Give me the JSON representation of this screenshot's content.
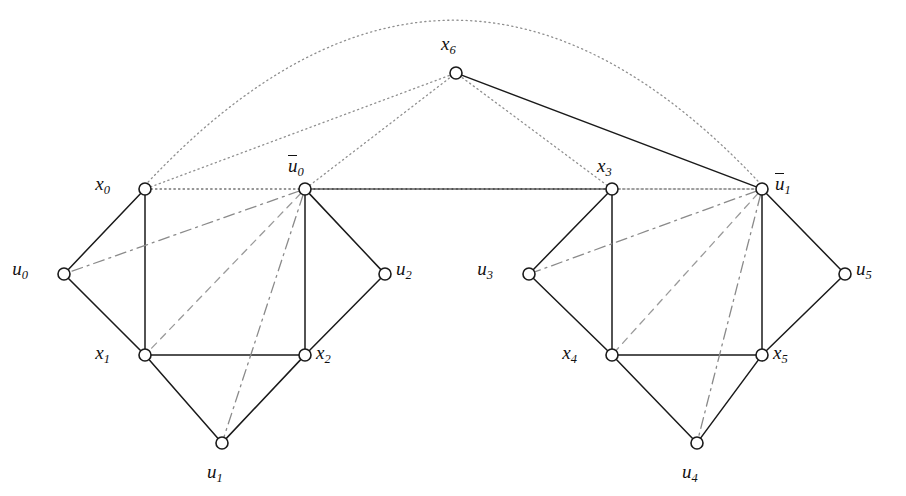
{
  "figure": {
    "type": "graph-diagram",
    "width": 906,
    "height": 496,
    "background": "#ffffff",
    "stroke_color": "#1a1a1a",
    "dotted_color": "#8f8f8f",
    "dashed_color": "#9a9a9a",
    "dashdot_color": "#8a8a8a",
    "node_fill": "#ffffff",
    "node_radius": 6
  },
  "nodes": [
    {
      "id": "x0",
      "label": "x",
      "sub": "0",
      "bar": false,
      "x": 145,
      "y": 189,
      "label_x": 110,
      "label_y": 174,
      "label_align": "right"
    },
    {
      "id": "u0b",
      "label": "u",
      "sub": "0",
      "bar": true,
      "x": 305,
      "y": 189,
      "label_x": 288,
      "label_y": 156,
      "label_align": "center"
    },
    {
      "id": "x3",
      "label": "x",
      "sub": "3",
      "bar": false,
      "x": 612,
      "y": 189,
      "label_x": 597,
      "label_y": 156,
      "label_align": "center"
    },
    {
      "id": "u1b",
      "label": "u",
      "sub": "1",
      "bar": true,
      "x": 762,
      "y": 189,
      "label_x": 775,
      "label_y": 174,
      "label_align": "left"
    },
    {
      "id": "x6",
      "label": "x",
      "sub": "6",
      "bar": false,
      "x": 456,
      "y": 73,
      "label_x": 441,
      "label_y": 34,
      "label_align": "center"
    },
    {
      "id": "u0",
      "label": "u",
      "sub": "0",
      "bar": false,
      "x": 64,
      "y": 274,
      "label_x": 28,
      "label_y": 259,
      "label_align": "right"
    },
    {
      "id": "u2",
      "label": "u",
      "sub": "2",
      "bar": false,
      "x": 385,
      "y": 274,
      "label_x": 396,
      "label_y": 259,
      "label_align": "left"
    },
    {
      "id": "u3",
      "label": "u",
      "sub": "3",
      "bar": false,
      "x": 529,
      "y": 274,
      "label_x": 493,
      "label_y": 259,
      "label_align": "right"
    },
    {
      "id": "u5",
      "label": "u",
      "sub": "5",
      "bar": false,
      "x": 845,
      "y": 274,
      "label_x": 856,
      "label_y": 259,
      "label_align": "left"
    },
    {
      "id": "x1",
      "label": "x",
      "sub": "1",
      "bar": false,
      "x": 145,
      "y": 355,
      "label_x": 110,
      "label_y": 343,
      "label_align": "right"
    },
    {
      "id": "x2",
      "label": "x",
      "sub": "2",
      "bar": false,
      "x": 305,
      "y": 355,
      "label_x": 316,
      "label_y": 343,
      "label_align": "left"
    },
    {
      "id": "x4",
      "label": "x",
      "sub": "4",
      "bar": false,
      "x": 612,
      "y": 355,
      "label_x": 577,
      "label_y": 343,
      "label_align": "right"
    },
    {
      "id": "x5",
      "label": "x",
      "sub": "5",
      "bar": false,
      "x": 762,
      "y": 355,
      "label_x": 773,
      "label_y": 343,
      "label_align": "left"
    },
    {
      "id": "u1",
      "label": "u",
      "sub": "1",
      "bar": false,
      "x": 222,
      "y": 443,
      "label_x": 207,
      "label_y": 462,
      "label_align": "center"
    },
    {
      "id": "u4",
      "label": "u",
      "sub": "4",
      "bar": false,
      "x": 697,
      "y": 443,
      "label_x": 682,
      "label_y": 462,
      "label_align": "center"
    }
  ],
  "edges": [
    {
      "from": "x0",
      "to": "u0",
      "style": "solid"
    },
    {
      "from": "x0",
      "to": "x1",
      "style": "solid"
    },
    {
      "from": "u0",
      "to": "x1",
      "style": "solid"
    },
    {
      "from": "x1",
      "to": "x2",
      "style": "solid"
    },
    {
      "from": "x1",
      "to": "u1",
      "style": "solid"
    },
    {
      "from": "x2",
      "to": "u1",
      "style": "solid"
    },
    {
      "from": "x2",
      "to": "u2",
      "style": "solid"
    },
    {
      "from": "u2",
      "to": "u0b",
      "style": "solid"
    },
    {
      "from": "u0b",
      "to": "x2",
      "style": "solid"
    },
    {
      "from": "u0b",
      "to": "x3",
      "style": "solid"
    },
    {
      "from": "x3",
      "to": "u3",
      "style": "solid"
    },
    {
      "from": "x3",
      "to": "x4",
      "style": "solid"
    },
    {
      "from": "u3",
      "to": "x4",
      "style": "solid"
    },
    {
      "from": "x4",
      "to": "x5",
      "style": "solid"
    },
    {
      "from": "x4",
      "to": "u4",
      "style": "solid"
    },
    {
      "from": "x5",
      "to": "u4",
      "style": "solid"
    },
    {
      "from": "x5",
      "to": "u5",
      "style": "solid"
    },
    {
      "from": "u5",
      "to": "u1b",
      "style": "solid"
    },
    {
      "from": "u1b",
      "to": "x5",
      "style": "solid"
    },
    {
      "from": "x6",
      "to": "u1b",
      "style": "solid"
    },
    {
      "from": "u0b",
      "to": "u0",
      "style": "dashdot"
    },
    {
      "from": "u0b",
      "to": "x1",
      "style": "dashed"
    },
    {
      "from": "u0b",
      "to": "u1",
      "style": "dashdot"
    },
    {
      "from": "u1b",
      "to": "u3",
      "style": "dashdot"
    },
    {
      "from": "u1b",
      "to": "x4",
      "style": "dashed"
    },
    {
      "from": "u1b",
      "to": "u4",
      "style": "dashdot"
    },
    {
      "from": "x0",
      "to": "u0b",
      "style": "dotted"
    },
    {
      "from": "u0b",
      "to": "u1b",
      "style": "dotted"
    },
    {
      "from": "x3",
      "to": "u1b",
      "style": "dotted"
    },
    {
      "from": "x0",
      "to": "x6",
      "style": "dotted"
    },
    {
      "from": "u0b",
      "to": "x6",
      "style": "dotted"
    },
    {
      "from": "x3",
      "to": "x6",
      "style": "dotted"
    },
    {
      "from": "x0",
      "to": "x3",
      "style": "dotted"
    },
    {
      "from": "x0",
      "to": "u1b",
      "style": "dotted-arc",
      "arc_peak_y": 22
    }
  ]
}
